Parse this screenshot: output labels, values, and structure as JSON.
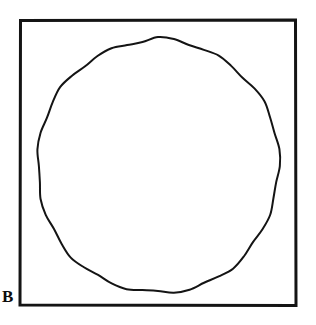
{
  "figure": {
    "panel_label": "B",
    "caption_text": "",
    "background_color": "#ffffff",
    "ink_color": "#141414",
    "frame": {
      "name": "square-frame",
      "x": 19,
      "y": 19,
      "width": 278,
      "height": 288,
      "stroke_width": 3,
      "stroke_color": "#141414",
      "fill": "none"
    },
    "shape": {
      "name": "circle-outline",
      "type": "circle",
      "center_x": 158,
      "center_y": 166,
      "radius_x": 121,
      "radius_y": 127,
      "stroke_width": 2,
      "stroke_color": "#141414",
      "fill": "none",
      "style": "hand-drawn"
    }
  },
  "chart_data": {
    "type": "diagram",
    "title": "B",
    "elements": [
      {
        "id": "frame",
        "shape": "square",
        "label": "",
        "filled": false
      },
      {
        "id": "circle",
        "shape": "circle",
        "label": "",
        "filled": false
      }
    ],
    "labels": [
      "B"
    ],
    "legend": [],
    "grid": false
  }
}
